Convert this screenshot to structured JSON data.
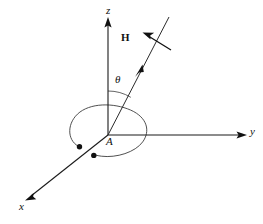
{
  "figure": {
    "kind": "3d-coordinate-diagram",
    "background_color": "#ffffff",
    "stroke_color": "#1a1a1a",
    "width": 263,
    "height": 224,
    "axes": [
      {
        "id": "z",
        "label": "z",
        "label_x": 110,
        "label_y": 7,
        "from_x": 108,
        "from_y": 135,
        "to_x": 108,
        "to_y": 22,
        "arrow": "end"
      },
      {
        "id": "y",
        "label": "y",
        "label_x": 251,
        "label_y": 128,
        "from_x": 108,
        "from_y": 135,
        "to_x": 246,
        "to_y": 135,
        "arrow": "end"
      },
      {
        "id": "x",
        "label": "x",
        "label_x": 20,
        "label_y": 203,
        "from_x": 108,
        "from_y": 135,
        "to_x": 27,
        "to_y": 199,
        "arrow": "end"
      }
    ],
    "origin": {
      "label": "A",
      "label_x": 107,
      "label_y": 137,
      "x": 108,
      "y": 135
    },
    "angle": {
      "label": "θ",
      "label_x": 115,
      "label_y": 75,
      "arc_radius": 44,
      "from_axis": "z",
      "to": "field-direction-line"
    },
    "field_vector": {
      "label": "H",
      "label_x": 123,
      "label_y": 33,
      "line_from_x": 108,
      "line_from_y": 135,
      "line_to_x": 169,
      "line_to_y": 17,
      "mid_arrow_x": 139,
      "mid_arrow_y": 72,
      "pointer_from_x": 170,
      "pointer_from_y": 49,
      "pointer_to_x": 144,
      "pointer_to_y": 33
    },
    "coil": {
      "center_x": 108,
      "center_y": 133,
      "radius_x": 38,
      "radius_y": 27,
      "rotation_deg": -8,
      "gap_note": "open loop with two lead terminals at lower-left"
    },
    "terminals": [
      {
        "id": "terminal-upper",
        "x": 79.5,
        "y": 146.5,
        "r": 2.6
      },
      {
        "id": "terminal-lower",
        "x": 93.5,
        "y": 155.5,
        "r": 2.6
      }
    ]
  }
}
